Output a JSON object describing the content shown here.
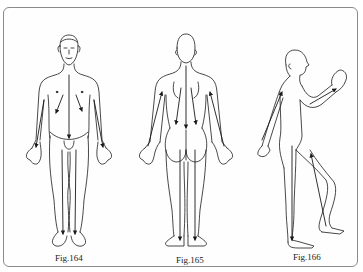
{
  "figure_panel": {
    "figures": [
      {
        "id": "fig164",
        "caption": "Fig.164",
        "view": "front"
      },
      {
        "id": "fig165",
        "caption": "Fig.165",
        "view": "back"
      },
      {
        "id": "fig166",
        "caption": "Fig.166",
        "view": "side"
      }
    ],
    "colors": {
      "line": "#1a1a1a",
      "frame": "#8a8a8a",
      "background": "#ffffff"
    }
  }
}
